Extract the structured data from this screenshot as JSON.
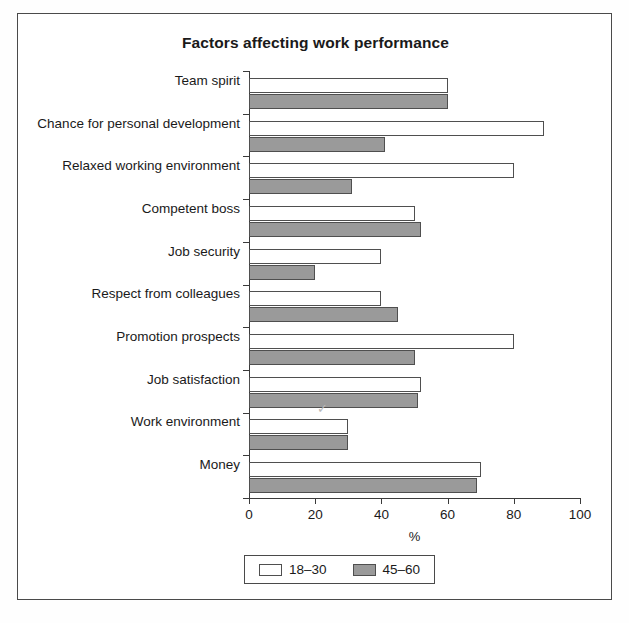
{
  "chart_data": {
    "type": "bar",
    "orientation": "horizontal",
    "title": "Factors affecting work performance",
    "xlabel": "%",
    "ylabel": "",
    "xlim": [
      0,
      100
    ],
    "xticks": [
      0,
      20,
      40,
      60,
      80,
      100
    ],
    "xtick_labels": [
      "0",
      "20",
      "40",
      "60",
      "80",
      "100"
    ],
    "grid": false,
    "legend_position": "bottom-center",
    "categories": [
      "Team spirit",
      "Chance for personal development",
      "Relaxed working environment",
      "Competent boss",
      "Job security",
      "Respect from colleagues",
      "Promotion prospects",
      "Job satisfaction",
      "Work environment",
      "Money"
    ],
    "series": [
      {
        "name": "18–30",
        "color": "#ffffff",
        "values": [
          60,
          89,
          80,
          50,
          40,
          40,
          80,
          52,
          30,
          70
        ]
      },
      {
        "name": "45–60",
        "color": "#9a9a9a",
        "values": [
          60,
          41,
          31,
          52,
          20,
          45,
          50,
          51,
          30,
          69
        ]
      }
    ],
    "annotations": [
      {
        "name": "check-mark",
        "text": "✓",
        "near_category": "Promotion prospects"
      }
    ]
  },
  "legend": {
    "entries": [
      {
        "label": "18–30",
        "swatch": "white-square-swatch"
      },
      {
        "label": "45–60",
        "swatch": "gray-square-swatch"
      }
    ]
  }
}
